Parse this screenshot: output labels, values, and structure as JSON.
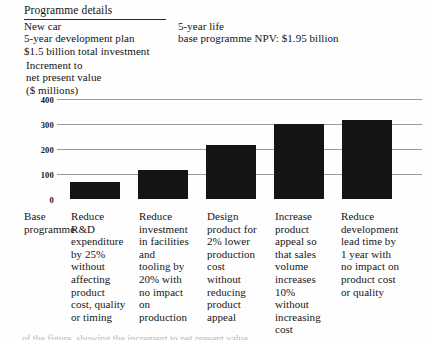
{
  "panel": {
    "title": "Programme details",
    "details": "New car\n5-year development plan\n$1.5 billion total investment",
    "right_note": "5-year life\nbase programme NPV: $1.95 billion"
  },
  "axis_title": "Increment to\nnet present value\n($ millions)",
  "bottom_caption": "of the figure, showing the increment to net present value",
  "chart_data": {
    "type": "bar",
    "title": "Increment to net present value ($ millions)",
    "xlabel": "",
    "ylabel": "Increment to net present value ($ millions)",
    "ylim": [
      0,
      400
    ],
    "yticks": [
      0,
      100,
      200,
      300,
      400
    ],
    "ytick_labels": [
      "0",
      "100",
      "200",
      "300",
      "400"
    ],
    "grid": true,
    "legend": "none",
    "bar_color": "#141414",
    "base_label": "Base\nprogramme",
    "categories": [
      "Reduce\nR&D\nexpenditure\nby 25%\nwithout\naffecting\nproduct\ncost, quality\nor timing",
      "Reduce\ninvestment\nin facilities\nand\ntooling by\n20% with\nno impact\non\nproduction",
      "Design\nproduct for\n2% lower\nproduction\ncost\nwithout\nreducing\nproduct\nappeal",
      "Increase\nproduct\nappeal so\nthat sales\nvolume\nincreases\n10%\nwithout\nincreasing\ncost",
      "Reduce\ndevelopment\nlead time by\n1 year with\nno impact on\nproduct cost\nor quality"
    ],
    "values": [
      70,
      115,
      215,
      300,
      315
    ]
  }
}
